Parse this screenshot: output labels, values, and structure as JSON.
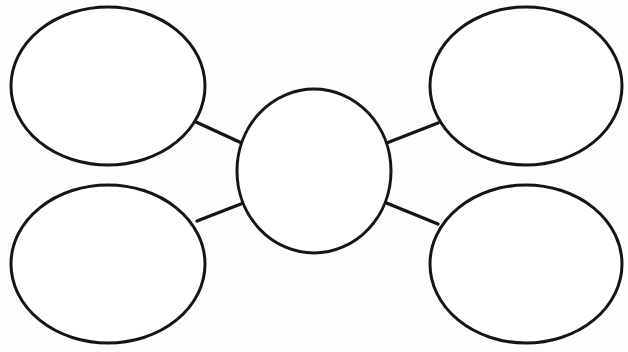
{
  "document": {
    "title": "Concept Web Graphic Organizer",
    "background_color": "#fdfdfd",
    "stroke_color": "#151515",
    "fill_color": "#ffffff",
    "width": 628,
    "height": 352
  },
  "diagram": {
    "type": "concept-web",
    "stroke_width": 3,
    "connector_stroke_width": 3.4,
    "center_node": {
      "id": "center",
      "label": "",
      "cx": 314,
      "cy": 171,
      "rx": 77,
      "ry": 82
    },
    "outer_nodes": [
      {
        "id": "top-left",
        "label": "",
        "cx": 108,
        "cy": 86,
        "rx": 97,
        "ry": 79
      },
      {
        "id": "top-right",
        "label": "",
        "cx": 526,
        "cy": 86,
        "rx": 96,
        "ry": 79
      },
      {
        "id": "bottom-left",
        "label": "",
        "cx": 108,
        "cy": 264,
        "rx": 97,
        "ry": 79
      },
      {
        "id": "bottom-right",
        "label": "",
        "cx": 526,
        "cy": 264,
        "rx": 96,
        "ry": 79
      }
    ],
    "connectors": [
      {
        "id": "connector-top-left",
        "from": "top-left",
        "to": "center",
        "x1": 196,
        "y1": 122,
        "x2": 246,
        "y2": 145
      },
      {
        "id": "connector-top-right",
        "from": "center",
        "to": "top-right",
        "x1": 384,
        "y1": 144,
        "x2": 438,
        "y2": 123
      },
      {
        "id": "connector-bottom-left",
        "from": "bottom-left",
        "to": "center",
        "x1": 197,
        "y1": 221,
        "x2": 246,
        "y2": 202
      },
      {
        "id": "connector-bottom-right",
        "from": "center",
        "to": "bottom-right",
        "x1": 384,
        "y1": 202,
        "x2": 438,
        "y2": 224
      }
    ]
  }
}
